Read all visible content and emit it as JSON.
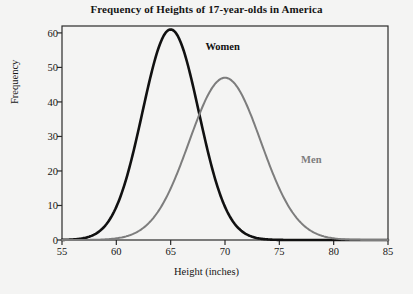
{
  "chart_data": {
    "type": "line",
    "title": "Frequency of Heights of 17-year-olds in America",
    "xlabel": "Height (inches)",
    "ylabel": "Frequency",
    "xlim": [
      55,
      85
    ],
    "ylim": [
      0,
      62
    ],
    "xticks": [
      55,
      60,
      65,
      70,
      75,
      80,
      85
    ],
    "yticks": [
      0,
      10,
      20,
      30,
      40,
      50,
      60
    ],
    "grid": false,
    "legend": "inline-annotations",
    "annotations": [
      {
        "text": "Women",
        "x": 68.2,
        "y": 55.5,
        "color": "#111111"
      },
      {
        "text": "Men",
        "x": 77.0,
        "y": 23.0,
        "color": "#7d7d7d"
      }
    ],
    "series": [
      {
        "name": "Women",
        "color": "#111111",
        "linewidth": 2.6,
        "peak_x": 65,
        "peak_y": 61,
        "sigma": 2.6,
        "x": [
          55,
          56,
          57,
          58,
          59,
          60,
          61,
          62,
          63,
          64,
          65,
          66,
          67,
          68,
          69,
          70,
          71,
          72,
          73,
          74,
          75,
          76,
          77,
          78,
          79,
          80,
          81,
          82,
          83,
          84,
          85
        ],
        "y": [
          0.2,
          0.5,
          1.1,
          2.4,
          5.0,
          9.3,
          16.0,
          25.2,
          36.4,
          48.0,
          57.3,
          61.0,
          57.3,
          48.0,
          36.4,
          25.2,
          16.0,
          9.3,
          5.0,
          2.4,
          1.1,
          0.5,
          0.2,
          0.1,
          0.0,
          0.0,
          0.0,
          0.0,
          0.0,
          0.0,
          0.0
        ]
      },
      {
        "name": "Men",
        "color": "#7d7d7d",
        "linewidth": 2.0,
        "peak_x": 70,
        "peak_y": 47,
        "sigma": 3.3,
        "x": [
          55,
          56,
          57,
          58,
          59,
          60,
          61,
          62,
          63,
          64,
          65,
          66,
          67,
          68,
          69,
          70,
          71,
          72,
          73,
          74,
          75,
          76,
          77,
          78,
          79,
          80,
          81,
          82,
          83,
          84,
          85
        ],
        "y": [
          0.2,
          0.4,
          0.8,
          1.5,
          2.7,
          4.6,
          7.4,
          11.3,
          16.4,
          22.5,
          29.2,
          35.8,
          41.5,
          45.3,
          47.0,
          47.0,
          45.3,
          41.5,
          35.8,
          29.2,
          22.5,
          16.4,
          11.3,
          7.4,
          4.6,
          2.7,
          1.5,
          0.8,
          0.4,
          0.2,
          0.1
        ]
      }
    ]
  },
  "axes": {
    "frame_color": "#2a2a2a",
    "background": "#f4f4f3"
  }
}
